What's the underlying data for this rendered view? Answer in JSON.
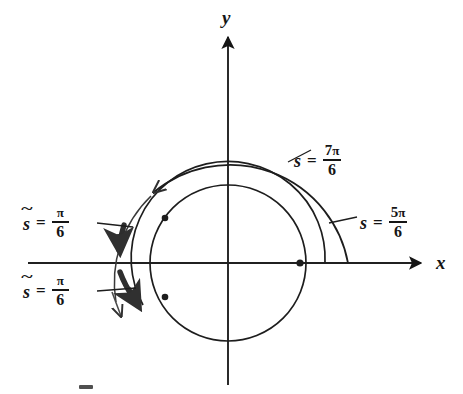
{
  "figure": {
    "type": "math-diagram",
    "width": 463,
    "height": 394,
    "background_color": "#ffffff",
    "ink_color": "#151515"
  },
  "axes": {
    "x_label": "x",
    "y_label": "y",
    "origin": {
      "x": 228,
      "y": 263
    },
    "x_axis": {
      "x_start": 28,
      "x_end": 425,
      "arrow": "right"
    },
    "y_axis": {
      "y_start": 33,
      "y_end": 385,
      "arrow": "up"
    }
  },
  "circle": {
    "name": "unit-circle",
    "center_x": 228,
    "center_y": 263,
    "radius": 78,
    "marked_point_on_x_axis": {
      "x": 300,
      "y": 263
    }
  },
  "spirals": [
    {
      "name": "outer-spiral-arc",
      "radius": 127,
      "end_on_x_axis": {
        "x": 348,
        "y": 263
      },
      "arrowhead_at": {
        "x": 152,
        "y": 188
      },
      "weight": "thin"
    },
    {
      "name": "middle-spiral-arc",
      "radius": 103,
      "end_on_x_axis": {
        "x": 325,
        "y": 263
      },
      "weight": "thin"
    }
  ],
  "bold_arcs": [
    {
      "name": "upper-bold-arc",
      "description": "bold arc from pi/6 above the negative x-axis down to the negative x-axis, arrowhead pointing down",
      "arrowhead_at": {
        "x": 140,
        "y": 252
      }
    },
    {
      "name": "lower-bold-arc",
      "description": "bold arc from negative x-axis down through pi/6 below, arrowhead pointing down-left",
      "arrowhead_at": {
        "x": 142,
        "y": 306
      }
    }
  ],
  "dots": [
    {
      "name": "dot-upper-left",
      "x": 165,
      "y": 218
    },
    {
      "name": "dot-lower-left",
      "x": 165,
      "y": 297
    },
    {
      "name": "dot-on-x-axis",
      "x": 300,
      "y": 263
    }
  ],
  "labels": [
    {
      "id": "s_7pi_6",
      "name": "label-s-equals-7pi-over-6",
      "variable": "s",
      "tilde": false,
      "equals": "=",
      "numerator_coefficient": "7",
      "numerator_symbol": "π",
      "denominator": "6",
      "text": "s = 7π/6",
      "left": 294,
      "top": 143
    },
    {
      "id": "s_5pi_6",
      "name": "label-s-equals-5pi-over-6",
      "variable": "s",
      "tilde": false,
      "equals": "=",
      "numerator_coefficient": "5",
      "numerator_symbol": "π",
      "denominator": "6",
      "text": "s = 5π/6",
      "left": 360,
      "top": 205
    },
    {
      "id": "stilde_pi_6_upper",
      "name": "label-s-tilde-equals-pi-over-6-upper",
      "variable": "s",
      "tilde": true,
      "equals": "=",
      "numerator_coefficient": "",
      "numerator_symbol": "π",
      "denominator": "6",
      "text": "s̃ = π/6",
      "left": 23,
      "top": 205
    },
    {
      "id": "stilde_pi_6_lower",
      "name": "label-s-tilde-equals-pi-over-6-lower",
      "variable": "s",
      "tilde": true,
      "equals": "=",
      "numerator_coefficient": "",
      "numerator_symbol": "π",
      "denominator": "6",
      "text": "s̃ = π/6",
      "left": 23,
      "top": 273
    }
  ],
  "leader_lines": [
    {
      "name": "leader-to-7pi-6",
      "from": {
        "x": 290,
        "y": 160
      },
      "to": {
        "x": 312,
        "y": 148
      }
    },
    {
      "name": "leader-to-5pi-6",
      "from": {
        "x": 330,
        "y": 222
      },
      "to": {
        "x": 356,
        "y": 216
      }
    },
    {
      "name": "leader-upper-s-tilde",
      "from": {
        "x": 98,
        "y": 223
      },
      "to": {
        "x": 133,
        "y": 227
      }
    },
    {
      "name": "leader-lower-s-tilde",
      "from": {
        "x": 98,
        "y": 291
      },
      "to": {
        "x": 136,
        "y": 288
      }
    }
  ]
}
